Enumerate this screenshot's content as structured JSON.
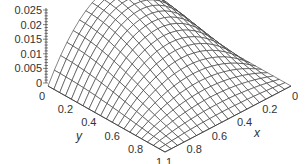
{
  "chart_data": {
    "type": "surface3d",
    "title": "",
    "xlabel": "x",
    "ylabel": "y",
    "zlabel": "",
    "x_ticks": [
      "0",
      "0.2",
      "0.4",
      "0.6",
      "0.8",
      "1"
    ],
    "y_ticks": [
      "0",
      "0.2",
      "0.4",
      "0.6",
      "0.8",
      "1"
    ],
    "z_ticks": [
      "0",
      "0.005",
      "0.01",
      "0.015",
      "0.02",
      "0.025"
    ],
    "xlim": [
      0,
      1
    ],
    "ylim": [
      0,
      1
    ],
    "zlim": [
      0,
      0.025
    ],
    "grid_resolution": 20,
    "peak_value": 0.022
  },
  "colors": {
    "mesh": "#333333",
    "axis": "#333333",
    "fill": "#ffffff"
  }
}
